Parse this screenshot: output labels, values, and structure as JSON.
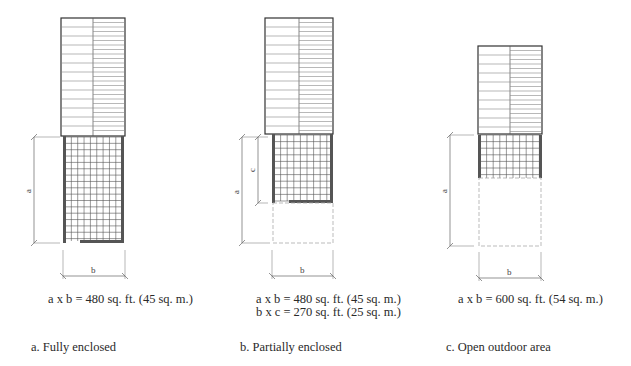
{
  "panels": [
    {
      "id": "a",
      "formulas": [
        "a x b = 480 sq. ft. (45 sq. m.)"
      ],
      "caption": "a.  Fully enclosed",
      "dimension_labels": [
        "a",
        "b"
      ]
    },
    {
      "id": "b",
      "formulas": [
        "a x b = 480 sq. ft. (45 sq. m.)",
        "b x c = 270 sq. ft. (25 sq. m.)"
      ],
      "caption": "b.  Partially enclosed",
      "dimension_labels": [
        "a",
        "c",
        "b"
      ]
    },
    {
      "id": "c",
      "formulas": [
        "a x b = 600 sq. ft. (54 sq. m.)"
      ],
      "caption": "c.  Open outdoor area",
      "dimension_labels": [
        "a",
        "b"
      ]
    }
  ],
  "colors": {
    "line": "#333333",
    "grid": "#555555",
    "dashed": "#999999",
    "wall": "#555555"
  }
}
